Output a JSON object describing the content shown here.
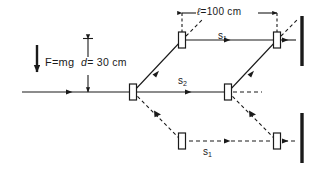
{
  "figure": {
    "name": "atom-interferometer-beam-path-diagram",
    "background_color": "#ffffff",
    "line_color": "#1a1a1a",
    "width": 317,
    "height": 169
  },
  "labels": {
    "force": {
      "text": "F=mg",
      "symbol": "F",
      "value": "mg",
      "arrow_direction": "down"
    },
    "separation_d": {
      "symbol": "d",
      "text": "= 30 cm",
      "value": 30,
      "unit": "cm",
      "orientation": "vertical"
    },
    "length_l": {
      "symbol": "ℓ",
      "text": "=100 cm",
      "value": 100,
      "unit": "cm",
      "orientation": "horizontal"
    },
    "s1_top": {
      "symbol": "s",
      "subscript": "1"
    },
    "s2_middle": {
      "symbol": "s",
      "subscript": "2"
    },
    "s1_bottom": {
      "symbol": "s",
      "subscript": "1"
    }
  },
  "elements": {
    "beam_splitters": [
      {
        "name": "splitter-input",
        "x": 133,
        "y": 92
      },
      {
        "name": "splitter-upper-left",
        "x": 182,
        "y": 40
      },
      {
        "name": "splitter-middle-right",
        "x": 228,
        "y": 92
      },
      {
        "name": "splitter-lower-left",
        "x": 182,
        "y": 141
      },
      {
        "name": "splitter-upper-right",
        "x": 277,
        "y": 40
      },
      {
        "name": "splitter-lower-right",
        "x": 277,
        "y": 141
      }
    ],
    "detectors": [
      {
        "name": "detector-upper",
        "x": 301,
        "y_top": 16,
        "y_bottom": 66
      },
      {
        "name": "detector-lower",
        "x": 301,
        "y_top": 113,
        "y_bottom": 163
      }
    ],
    "beams_solid": [
      "input-horizontal",
      "upper-arm-rise",
      "upper-arm-horizontal",
      "middle-arm-horizontal",
      "middle-arm-rise",
      "upper-right-exit"
    ],
    "beams_dashed": [
      "lower-arm-fall",
      "lower-arm-horizontal",
      "lower-right-fall",
      "middle-right-continue",
      "upper-left-stub",
      "upper-right-stub",
      "lower-right-exit"
    ]
  }
}
